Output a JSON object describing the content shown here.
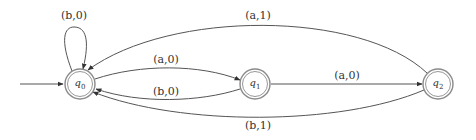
{
  "diagram": {
    "type": "finite-state-transducer",
    "start_state": "q0",
    "states": [
      {
        "id": "q0",
        "name": "q",
        "sub": "0",
        "accepting": true
      },
      {
        "id": "q1",
        "name": "q",
        "sub": "1",
        "accepting": true
      },
      {
        "id": "q2",
        "name": "q",
        "sub": "2",
        "accepting": true
      }
    ],
    "transitions": [
      {
        "from": "q0",
        "to": "q0",
        "label": "(b,0)"
      },
      {
        "from": "q0",
        "to": "q1",
        "label": "(a,0)"
      },
      {
        "from": "q1",
        "to": "q0",
        "label": "(b,0)"
      },
      {
        "from": "q1",
        "to": "q2",
        "label": "(a,0)"
      },
      {
        "from": "q2",
        "to": "q0",
        "label": "(a,1)"
      },
      {
        "from": "q2",
        "to": "q0",
        "label": "(b,1)"
      }
    ],
    "colors": {
      "edge": "#555555",
      "state_border": "#8a8a8a",
      "text": "#333333",
      "background": "#ffffff"
    }
  }
}
